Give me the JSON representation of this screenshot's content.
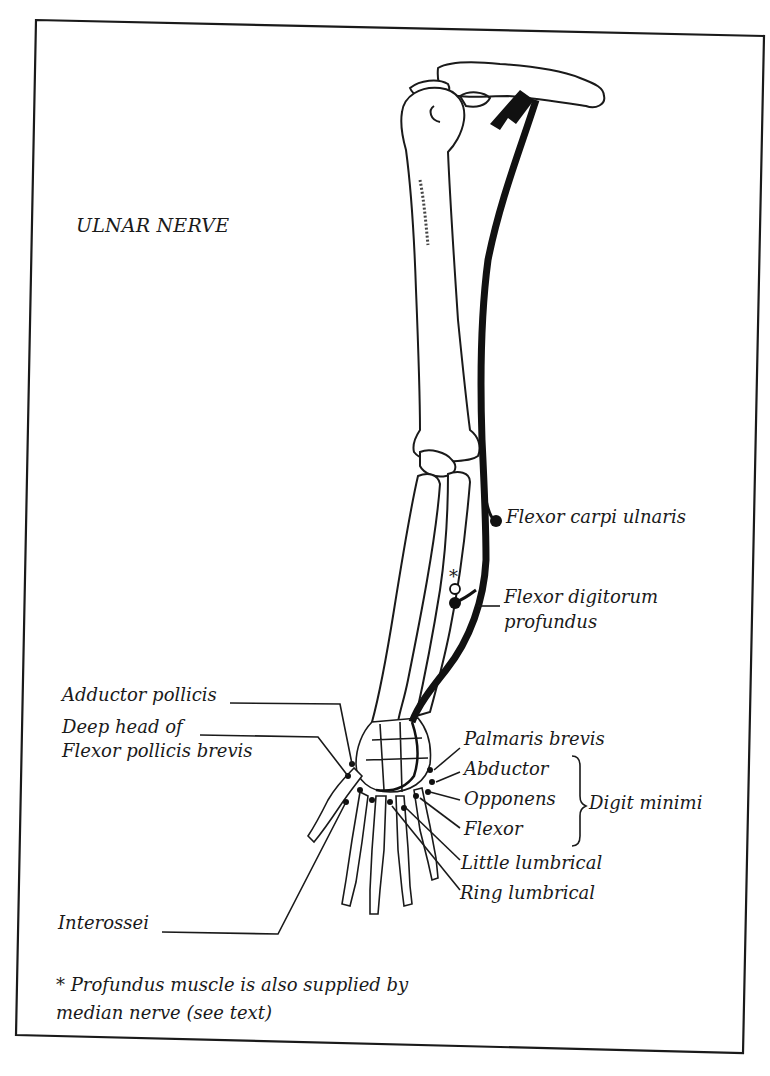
{
  "figure": {
    "title": "ULNAR NERVE",
    "colors": {
      "ink": "#1a1a1a",
      "nerve": "#111111",
      "paper": "#ffffff"
    }
  },
  "labels": {
    "flexor_carpi_ulnaris": "Flexor carpi ulnaris",
    "fdp_line1": "Flexor digitorum",
    "fdp_line2": "profundus",
    "asterisk": "*",
    "adductor_pollicis": "Adductor pollicis",
    "fpb_line1": "Deep head of",
    "fpb_line2": "Flexor pollicis brevis",
    "palmaris_brevis": "Palmaris brevis",
    "abductor": "Abductor",
    "opponens": "Opponens",
    "flexor": "Flexor",
    "digit_minimi": "Digit minimi",
    "little_lumbrical": "Little lumbrical",
    "ring_lumbrical": "Ring lumbrical",
    "interossei": "Interossei"
  },
  "footnote": {
    "line1": "* Profundus muscle is also supplied by",
    "line2": "median nerve (see text)"
  }
}
